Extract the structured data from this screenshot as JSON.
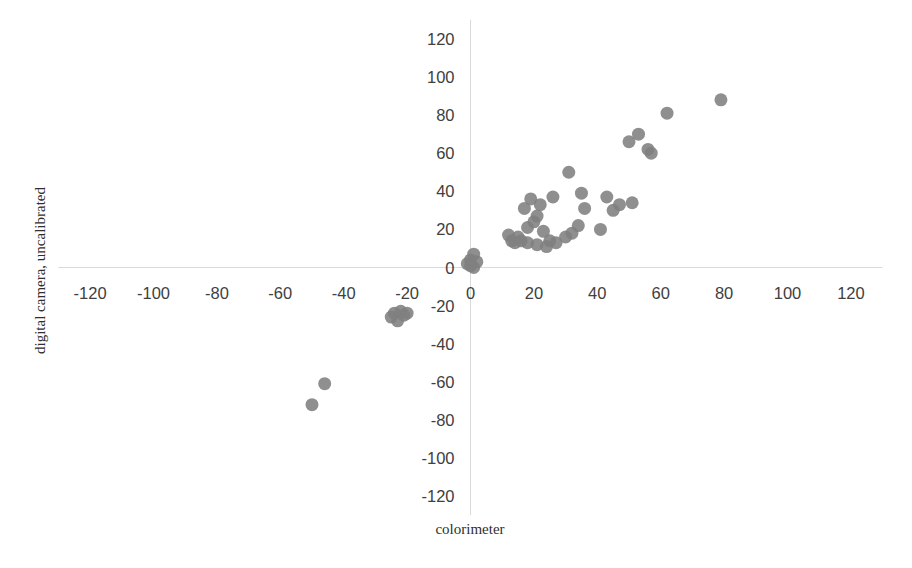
{
  "chart_data": {
    "type": "scatter",
    "title": "",
    "xlabel": "colorimeter",
    "ylabel": "digital camera, uncalibrated",
    "xlim": [
      -130,
      130
    ],
    "ylim": [
      -130,
      130
    ],
    "xticks": [
      -120,
      -100,
      -80,
      -60,
      -40,
      -20,
      0,
      20,
      40,
      60,
      80,
      100,
      120
    ],
    "yticks": [
      -120,
      -100,
      -80,
      -60,
      -40,
      -20,
      0,
      20,
      40,
      60,
      80,
      100,
      120
    ],
    "xtick_labels": [
      "-120",
      "-100",
      "-80",
      "-60",
      "-40",
      "-20",
      "0",
      "20",
      "40",
      "60",
      "80",
      "100",
      "120"
    ],
    "ytick_labels": [
      "-120",
      "-100",
      "-80",
      "-60",
      "-40",
      "-20",
      "0",
      "20",
      "40",
      "60",
      "80",
      "100",
      "120"
    ],
    "grid": false,
    "legend": false,
    "legend_position": "none",
    "marker": {
      "shape": "circle",
      "color": "#808080",
      "size_px": 13,
      "opacity": 0.88
    },
    "axis_line_color": "#d9d9d9",
    "series": [
      {
        "name": "measurements",
        "color": "#808080",
        "points": [
          [
            -50,
            -72
          ],
          [
            -46,
            -61
          ],
          [
            -25,
            -26
          ],
          [
            -24,
            -24
          ],
          [
            -23,
            -28
          ],
          [
            -22,
            -23
          ],
          [
            -21,
            -25
          ],
          [
            -20,
            -24
          ],
          [
            -1,
            2
          ],
          [
            0,
            1
          ],
          [
            0,
            4
          ],
          [
            1,
            0
          ],
          [
            1,
            7
          ],
          [
            2,
            3
          ],
          [
            12,
            17
          ],
          [
            13,
            14
          ],
          [
            14,
            13
          ],
          [
            15,
            16
          ],
          [
            16,
            14
          ],
          [
            17,
            31
          ],
          [
            18,
            21
          ],
          [
            18,
            13
          ],
          [
            19,
            36
          ],
          [
            20,
            24
          ],
          [
            21,
            12
          ],
          [
            21,
            27
          ],
          [
            22,
            33
          ],
          [
            23,
            19
          ],
          [
            24,
            11
          ],
          [
            25,
            14
          ],
          [
            26,
            37
          ],
          [
            27,
            13
          ],
          [
            30,
            16
          ],
          [
            31,
            50
          ],
          [
            32,
            18
          ],
          [
            34,
            22
          ],
          [
            35,
            39
          ],
          [
            36,
            31
          ],
          [
            41,
            20
          ],
          [
            43,
            37
          ],
          [
            45,
            30
          ],
          [
            47,
            33
          ],
          [
            50,
            66
          ],
          [
            51,
            34
          ],
          [
            53,
            70
          ],
          [
            56,
            62
          ],
          [
            57,
            60
          ],
          [
            62,
            81
          ],
          [
            79,
            88
          ]
        ]
      }
    ]
  },
  "axes": {
    "x_title": "colorimeter",
    "y_title": "digital camera, uncalibrated"
  }
}
